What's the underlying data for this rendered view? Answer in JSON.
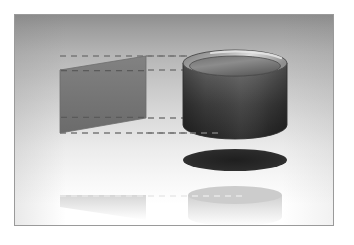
{
  "figure": {
    "domain": "diagram",
    "canvas": {
      "width": 354,
      "height": 245,
      "background": "#ffffff"
    },
    "plate": {
      "x": 14,
      "y": 14,
      "width": 320,
      "height": 212,
      "border_color": "#9a9a9a",
      "border_width": 1
    },
    "backdrop": {
      "type": "vertical-gradient",
      "top_color": "#8e8e8e",
      "mid_color": "#c9c9c9",
      "bottom_color": "#ffffff"
    }
  },
  "objects": {
    "quad": {
      "label": "rectangular-plane",
      "description": "Flat quadrilateral shown in perspective, darker gray fill",
      "fill_top": "#7d7d7d",
      "fill_bottom": "#6e6e6e",
      "stroke": "#6a6a6a",
      "points": "45,55 131,41 131,103 45,118",
      "opacity": 1
    },
    "cylinder": {
      "label": "cylinder",
      "description": "Open-topped cylinder with elliptical rim, dark body gradient",
      "center_x": 220,
      "rim_cy": 48,
      "rim_rx": 52,
      "rim_ry": 12,
      "base_cy": 110,
      "body_top_color": "#5e5e5e",
      "body_bottom_color": "#2e2e2e",
      "rim_outer_color": "#9e9e9e",
      "rim_inner_color": "#6c6c6c",
      "rim_highlight_color": "#d8d8d8",
      "stroke": "#3a3a3a"
    },
    "shadow": {
      "label": "ground-shadow",
      "description": "Dark solid ellipse beneath the cylinder",
      "cx": 220,
      "cy": 145,
      "rx": 52,
      "ry": 11,
      "color": "#2b2b2b"
    },
    "reflection_quad": {
      "label": "quad-reflection",
      "description": "Faint mirrored reflection of the quadrilateral",
      "points": "45,180 131,180 131,205 45,192",
      "color": "#e2e2e2",
      "opacity": 0.75
    },
    "reflection_cylinder": {
      "label": "cylinder-reflection",
      "description": "Faint mirrored reflection of the cylinder",
      "cx": 220,
      "top_cy": 180,
      "rx": 47,
      "ry": 9,
      "height": 26,
      "color": "#dddddd",
      "opacity": 0.8
    }
  },
  "projection_lines": {
    "label": "projection-guides",
    "description": "Dashed horizontal construction lines linking the plane to the cylinder",
    "color": "#787878",
    "dash_pattern": "6 5",
    "stroke_width": 1.4,
    "lines": [
      {
        "name": "guide-top",
        "x1": 45,
        "y1": 41,
        "x2": 232,
        "y2": 41
      },
      {
        "name": "guide-upper-mid",
        "x1": 45,
        "y1": 55,
        "x2": 232,
        "y2": 55
      },
      {
        "name": "guide-lower-mid",
        "x1": 45,
        "y1": 103,
        "x2": 232,
        "y2": 103
      },
      {
        "name": "guide-bottom",
        "x1": 45,
        "y1": 118,
        "x2": 232,
        "y2": 118
      }
    ],
    "reflected_line": {
      "name": "guide-reflection",
      "x1": 45,
      "y1": 181,
      "x2": 232,
      "y2": 181,
      "color": "#e8e8e8"
    }
  }
}
